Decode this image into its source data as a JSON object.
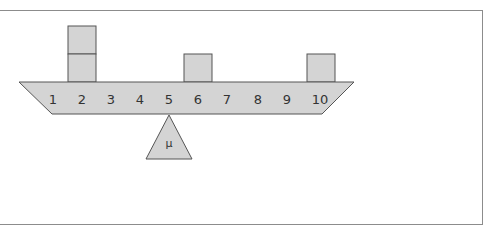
{
  "diagram": {
    "type": "balance-beam",
    "beam_labels": [
      "1",
      "2",
      "3",
      "4",
      "5",
      "6",
      "7",
      "8",
      "9",
      "10"
    ],
    "fulcrum_label": "μ",
    "fulcrum_position": 5,
    "blocks": [
      {
        "position": 2,
        "count": 2
      },
      {
        "position": 6,
        "count": 1
      },
      {
        "position": 10,
        "count": 1
      }
    ],
    "colors": {
      "fill": "#d4d4d4",
      "stroke": "#555555",
      "frame": "#8c8c8c"
    }
  }
}
